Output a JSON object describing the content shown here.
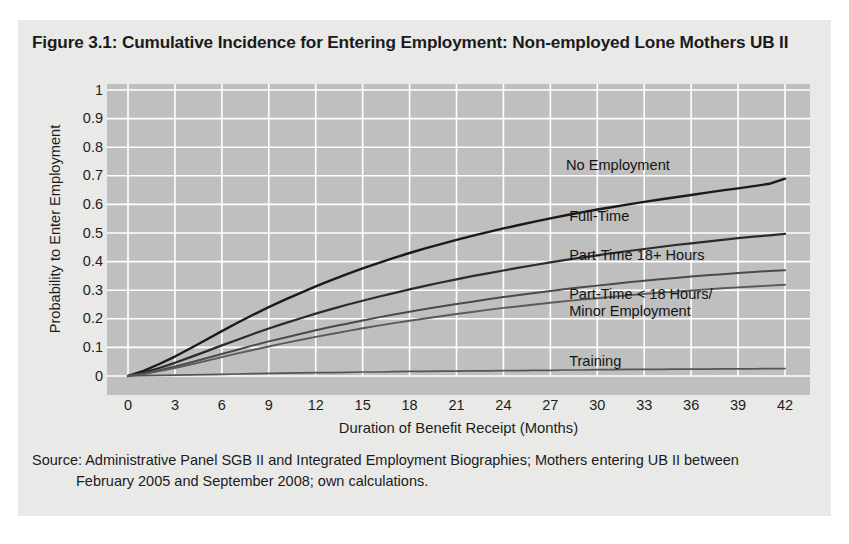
{
  "figure": {
    "title": "Figure 3.1: Cumulative Incidence for Entering Employment: Non-employed Lone Mothers UB II",
    "source_line1": "Source: Administrative Panel SGB II and Integrated Employment Biographies; Mothers entering UB II between",
    "source_line2": "February 2005 and September 2008; own calculations.",
    "plot_background": "#bfbfbf",
    "grid_color": "#ffffff",
    "panel_background": "#e9e9e7"
  },
  "chart_data": {
    "type": "line",
    "title": "Figure 3.1: Cumulative Incidence for Entering Employment: Non-employed Lone Mothers UB II",
    "xlabel": "Duration of Benefit Receipt (Months)",
    "ylabel": "Probability to Enter Employment",
    "xlim": [
      0,
      42
    ],
    "ylim": [
      0,
      1
    ],
    "xticks": [
      0,
      3,
      6,
      9,
      12,
      15,
      18,
      21,
      24,
      27,
      30,
      33,
      36,
      39,
      42
    ],
    "yticks": [
      0,
      0.1,
      0.2,
      0.3,
      0.4,
      0.5,
      0.6,
      0.7,
      0.8,
      0.9,
      1
    ],
    "ytick_labels": [
      "0",
      "0.1",
      "0.2",
      "0.3",
      "0.4",
      "0.5",
      "0.6",
      "0.7",
      "0.8",
      "0.9",
      "1"
    ],
    "grid": true,
    "legend": "inline-labels",
    "x": [
      0,
      1,
      2,
      3,
      4,
      5,
      6,
      7,
      8,
      9,
      10,
      11,
      12,
      13,
      14,
      15,
      16,
      17,
      18,
      19,
      20,
      21,
      22,
      23,
      24,
      25,
      26,
      27,
      28,
      29,
      30,
      31,
      32,
      33,
      34,
      35,
      36,
      37,
      38,
      39,
      40,
      41,
      42
    ],
    "series": [
      {
        "name": "No Employment",
        "color": "#1a1a1a",
        "width": 2.4,
        "label_x": 28.0,
        "label_y": 0.735,
        "values": [
          0.0,
          0.018,
          0.042,
          0.068,
          0.097,
          0.127,
          0.157,
          0.186,
          0.214,
          0.241,
          0.266,
          0.29,
          0.313,
          0.335,
          0.356,
          0.376,
          0.395,
          0.413,
          0.43,
          0.446,
          0.461,
          0.476,
          0.49,
          0.503,
          0.516,
          0.528,
          0.54,
          0.551,
          0.562,
          0.572,
          0.582,
          0.591,
          0.6,
          0.609,
          0.617,
          0.625,
          0.633,
          0.641,
          0.649,
          0.656,
          0.664,
          0.672,
          0.69
        ]
      },
      {
        "name": "Full-Time",
        "color": "#2b2b2b",
        "width": 2.2,
        "label_x": 28.2,
        "label_y": 0.555,
        "values": [
          0.0,
          0.012,
          0.028,
          0.046,
          0.066,
          0.086,
          0.107,
          0.127,
          0.147,
          0.166,
          0.184,
          0.201,
          0.218,
          0.234,
          0.249,
          0.263,
          0.277,
          0.29,
          0.303,
          0.315,
          0.327,
          0.338,
          0.349,
          0.359,
          0.369,
          0.379,
          0.388,
          0.397,
          0.406,
          0.414,
          0.422,
          0.43,
          0.437,
          0.444,
          0.451,
          0.458,
          0.464,
          0.47,
          0.476,
          0.482,
          0.487,
          0.492,
          0.497
        ]
      },
      {
        "name": "Part-Time 18+ Hours",
        "color": "#4a4a4a",
        "width": 2.0,
        "label_x": 28.2,
        "label_y": 0.418,
        "values": [
          0.0,
          0.008,
          0.02,
          0.033,
          0.047,
          0.062,
          0.077,
          0.092,
          0.107,
          0.121,
          0.134,
          0.147,
          0.16,
          0.172,
          0.183,
          0.194,
          0.205,
          0.215,
          0.225,
          0.234,
          0.243,
          0.252,
          0.26,
          0.268,
          0.276,
          0.283,
          0.29,
          0.297,
          0.304,
          0.31,
          0.316,
          0.322,
          0.328,
          0.333,
          0.338,
          0.343,
          0.348,
          0.352,
          0.356,
          0.36,
          0.364,
          0.367,
          0.37
        ]
      },
      {
        "name": "Part-Time < 18 Hours/ Minor Employment",
        "label_lines": [
          "Part-Time < 18 Hours/",
          "Minor Employment"
        ],
        "color": "#5a5a5a",
        "width": 1.9,
        "label_x": 28.2,
        "label_y": 0.283,
        "values": [
          0.0,
          0.007,
          0.017,
          0.028,
          0.04,
          0.053,
          0.066,
          0.079,
          0.091,
          0.103,
          0.115,
          0.126,
          0.137,
          0.147,
          0.157,
          0.167,
          0.176,
          0.185,
          0.193,
          0.201,
          0.209,
          0.217,
          0.224,
          0.231,
          0.238,
          0.244,
          0.25,
          0.256,
          0.262,
          0.267,
          0.272,
          0.277,
          0.282,
          0.287,
          0.291,
          0.295,
          0.299,
          0.303,
          0.307,
          0.31,
          0.313,
          0.316,
          0.319
        ]
      },
      {
        "name": "Training",
        "color": "#555555",
        "width": 1.7,
        "label_x": 28.2,
        "label_y": 0.048,
        "values": [
          0.0,
          0.001,
          0.002,
          0.003,
          0.004,
          0.005,
          0.006,
          0.007,
          0.008,
          0.009,
          0.01,
          0.011,
          0.012,
          0.012,
          0.013,
          0.014,
          0.014,
          0.015,
          0.016,
          0.016,
          0.017,
          0.017,
          0.018,
          0.018,
          0.019,
          0.019,
          0.02,
          0.02,
          0.021,
          0.021,
          0.022,
          0.022,
          0.023,
          0.023,
          0.023,
          0.024,
          0.024,
          0.024,
          0.025,
          0.025,
          0.025,
          0.026,
          0.026
        ]
      }
    ]
  }
}
